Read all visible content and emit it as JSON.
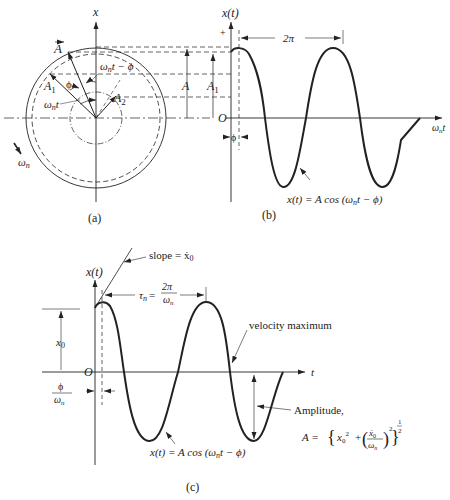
{
  "panel_a": {
    "caption": "(a)",
    "axis_label": "x",
    "vector_A": "A",
    "vector_A1": "A",
    "vector_A1_sub": "1",
    "vector_A2": "A",
    "vector_A2_sub": "2",
    "angle_phi": "ϕ",
    "angle_wt": "ω",
    "angle_wt_sub": "n",
    "angle_wt_t": "t",
    "angle_wt_minus_phi": "t − ϕ",
    "rotation": "ω",
    "rotation_sub": "n",
    "dim_A": "A",
    "dim_A1": "A",
    "dim_A1_sub": "1"
  },
  "panel_b": {
    "caption": "(b)",
    "y_label": "x(t)",
    "plus": "+",
    "origin": "O",
    "x_label_w": "ω",
    "x_label_sub": "n",
    "x_label_t": "t",
    "period": "2π",
    "phase": "ϕ",
    "equation": "x(t) = A cos (ω",
    "equation_sub": "n",
    "equation_tail": "t − ϕ)"
  },
  "panel_c": {
    "caption": "(c)",
    "y_label": "x(t)",
    "origin": "O",
    "x_label": "t",
    "slope_label": "slope = ẋ",
    "slope_sub": "0",
    "tau": "τ",
    "tau_sub": "n",
    "tau_eq": "=",
    "tau_num": "2π",
    "tau_den": "ω",
    "tau_den_sub": "n",
    "x0": "x",
    "x0_sub": "0",
    "phase_num": "ϕ",
    "phase_den": "ω",
    "phase_den_sub": "n",
    "velocity_label": "velocity maximum",
    "amplitude_label": "Amplitude,",
    "amplitude_eq_A": "A =",
    "amplitude_eq_x0": "x",
    "amplitude_eq_x0_sub": "0",
    "amplitude_eq_sq": "2",
    "amplitude_eq_plus": "+",
    "amplitude_eq_xdot": "ẋ",
    "amplitude_eq_xdot_sub": "0",
    "amplitude_eq_w": "ω",
    "amplitude_eq_w_sub": "n",
    "amplitude_eq_exp_num": "1",
    "amplitude_eq_exp_den": "2",
    "equation": "x(t) = A cos (ω",
    "equation_sub": "n",
    "equation_tail": "t − ϕ)"
  },
  "colors": {
    "line": "#222222",
    "background": "#ffffff"
  }
}
